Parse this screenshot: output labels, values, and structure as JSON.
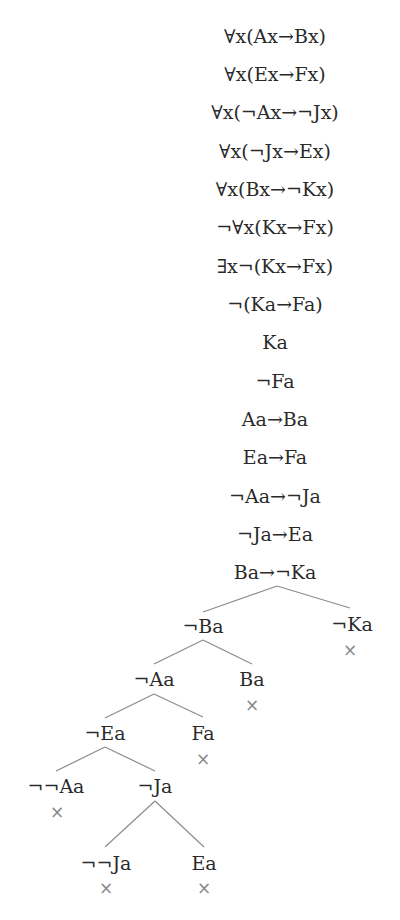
{
  "trunk": [
    "∀x(Ax→Bx)",
    "∀x(Ex→Fx)",
    "∀x(¬Ax→¬Jx)",
    "∀x(¬Jx→Ex)",
    "∀x(Bx→¬Kx)",
    "¬∀x(Kx→Fx)",
    "∃x¬(Kx→Fx)",
    "¬(Ka→Fa)",
    "Ka",
    "¬Fa",
    "Aa→Ba",
    "Ea→Fa",
    "¬Aa→¬Ja",
    "¬Ja→Ea",
    "Ba→¬Ka"
  ],
  "nodes": {
    "not_Ba": "¬Ba",
    "not_Ka": "¬Ka",
    "not_Aa": "¬Aa",
    "Ba": "Ba",
    "not_Ea": "¬Ea",
    "Fa": "Fa",
    "not_not_Aa": "¬¬Aa",
    "not_Ja": "¬Ja",
    "not_not_Ja": "¬¬Ja",
    "Ea": "Ea"
  },
  "closed_mark": "×",
  "colors": {
    "text": "#2a2a2a",
    "branch_line": "#8c8c8c",
    "closed_mark": "#8a8a8a"
  }
}
